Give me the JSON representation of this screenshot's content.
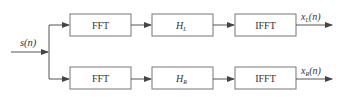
{
  "diagram": {
    "input_label": {
      "main": "s",
      "rest": "(n)"
    },
    "top_branch": {
      "fft_label": "FFT",
      "filter_label": {
        "main": "H",
        "sub": "L"
      },
      "ifft_label": "IFFT",
      "output_label": {
        "main": "x",
        "sub": "L",
        "rest": "(n)"
      }
    },
    "bottom_branch": {
      "fft_label": "FFT",
      "filter_label": {
        "main": "H",
        "sub": "R"
      },
      "ifft_label": "IFFT",
      "output_label": {
        "main": "x",
        "sub": "R",
        "rest": "(n)"
      }
    },
    "colors": {
      "line": "#555555",
      "box_border": "#666666",
      "text": "#333333"
    }
  }
}
